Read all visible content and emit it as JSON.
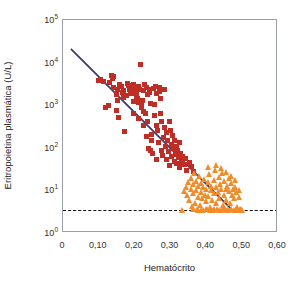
{
  "chart_data": {
    "type": "scatter",
    "title": "",
    "xlabel": "Hematócrito",
    "ylabel": "Eritropoietina plasmática (U/L)",
    "xlim": [
      0,
      0.6
    ],
    "ylim": [
      1,
      100000
    ],
    "yscale": "log",
    "grid": false,
    "legend": "none",
    "x_ticks": [
      "0",
      "0,10",
      "0,20",
      "0,30",
      "0,40",
      "0,50",
      "0,60"
    ],
    "x_tick_values": [
      0,
      0.1,
      0.2,
      0.3,
      0.4,
      0.5,
      0.6
    ],
    "x_minor_step": 0.05,
    "y_ticks": [
      "10",
      "10",
      "10",
      "10",
      "10",
      "10"
    ],
    "y_tick_exponents": [
      "0",
      "1",
      "2",
      "3",
      "4",
      "5"
    ],
    "y_tick_values": [
      1,
      10,
      100,
      1000,
      10000,
      100000
    ],
    "series": [
      {
        "name": "anemic-patients",
        "marker": "square",
        "color": "#be2e26",
        "points": [
          [
            0.1,
            3900
          ],
          [
            0.104,
            4100
          ],
          [
            0.112,
            3600
          ],
          [
            0.118,
            900
          ],
          [
            0.126,
            960
          ],
          [
            0.131,
            3500
          ],
          [
            0.135,
            5000
          ],
          [
            0.138,
            4300
          ],
          [
            0.14,
            4600
          ],
          [
            0.142,
            2600
          ],
          [
            0.148,
            1800
          ],
          [
            0.15,
            760
          ],
          [
            0.152,
            2400
          ],
          [
            0.156,
            520
          ],
          [
            0.158,
            3000
          ],
          [
            0.162,
            2800
          ],
          [
            0.166,
            2000
          ],
          [
            0.168,
            1500
          ],
          [
            0.17,
            2200
          ],
          [
            0.172,
            240
          ],
          [
            0.176,
            1700
          ],
          [
            0.18,
            3200
          ],
          [
            0.182,
            2900
          ],
          [
            0.186,
            2300
          ],
          [
            0.19,
            2600
          ],
          [
            0.192,
            1900
          ],
          [
            0.196,
            1250
          ],
          [
            0.198,
            3100
          ],
          [
            0.2,
            2700
          ],
          [
            0.202,
            2500
          ],
          [
            0.204,
            1600
          ],
          [
            0.206,
            2100
          ],
          [
            0.208,
            1400
          ],
          [
            0.21,
            1150
          ],
          [
            0.212,
            2800
          ],
          [
            0.214,
            2400
          ],
          [
            0.216,
            9000
          ],
          [
            0.218,
            1000
          ],
          [
            0.22,
            880
          ],
          [
            0.222,
            1300
          ],
          [
            0.224,
            2200
          ],
          [
            0.226,
            700
          ],
          [
            0.228,
            3100
          ],
          [
            0.23,
            640
          ],
          [
            0.232,
            180
          ],
          [
            0.234,
            2600
          ],
          [
            0.236,
            420
          ],
          [
            0.238,
            96
          ],
          [
            0.24,
            2000
          ],
          [
            0.242,
            2300
          ],
          [
            0.244,
            1100
          ],
          [
            0.246,
            200
          ],
          [
            0.248,
            150
          ],
          [
            0.25,
            74
          ],
          [
            0.252,
            2500
          ],
          [
            0.256,
            560
          ],
          [
            0.258,
            2800
          ],
          [
            0.26,
            1900
          ],
          [
            0.262,
            340
          ],
          [
            0.264,
            260
          ],
          [
            0.266,
            130
          ],
          [
            0.268,
            2100
          ],
          [
            0.27,
            2600
          ],
          [
            0.272,
            640
          ],
          [
            0.274,
            88
          ],
          [
            0.276,
            420
          ],
          [
            0.278,
            66
          ],
          [
            0.28,
            170
          ],
          [
            0.282,
            2300
          ],
          [
            0.284,
            300
          ],
          [
            0.286,
            110
          ],
          [
            0.288,
            52
          ],
          [
            0.29,
            230
          ],
          [
            0.292,
            150
          ],
          [
            0.294,
            82
          ],
          [
            0.296,
            38
          ],
          [
            0.298,
            420
          ],
          [
            0.3,
            260
          ],
          [
            0.302,
            120
          ],
          [
            0.304,
            64
          ],
          [
            0.306,
            190
          ],
          [
            0.308,
            95
          ],
          [
            0.31,
            48
          ],
          [
            0.312,
            150
          ],
          [
            0.314,
            70
          ],
          [
            0.316,
            110
          ],
          [
            0.318,
            42
          ],
          [
            0.32,
            86
          ],
          [
            0.322,
            58
          ],
          [
            0.324,
            130
          ],
          [
            0.326,
            34
          ],
          [
            0.328,
            72
          ],
          [
            0.33,
            46
          ],
          [
            0.334,
            62
          ],
          [
            0.338,
            40
          ],
          [
            0.342,
            55
          ],
          [
            0.346,
            30
          ],
          [
            0.352,
            44
          ],
          [
            0.358,
            36
          ],
          [
            0.364,
            28
          ],
          [
            0.152,
            1300
          ],
          [
            0.188,
            2050
          ],
          [
            0.236,
            1750
          ],
          [
            0.254,
            1050
          ],
          [
            0.272,
            1450
          ],
          [
            0.226,
            330
          ],
          [
            0.244,
            86
          ],
          [
            0.262,
            54
          ],
          [
            0.196,
            640
          ],
          [
            0.21,
            480
          ]
        ]
      },
      {
        "name": "normal-subjects",
        "marker": "triangle",
        "color": "#f28c28",
        "points": [
          [
            0.332,
            3.5
          ],
          [
            0.338,
            9.5
          ],
          [
            0.342,
            12
          ],
          [
            0.346,
            8
          ],
          [
            0.35,
            16
          ],
          [
            0.352,
            6
          ],
          [
            0.356,
            11
          ],
          [
            0.358,
            20
          ],
          [
            0.36,
            4.2
          ],
          [
            0.362,
            14
          ],
          [
            0.364,
            8.5
          ],
          [
            0.366,
            25
          ],
          [
            0.368,
            5
          ],
          [
            0.37,
            10
          ],
          [
            0.372,
            17
          ],
          [
            0.374,
            3.6
          ],
          [
            0.376,
            13
          ],
          [
            0.378,
            7
          ],
          [
            0.38,
            22
          ],
          [
            0.382,
            4.5
          ],
          [
            0.384,
            9
          ],
          [
            0.386,
            15
          ],
          [
            0.388,
            6.5
          ],
          [
            0.39,
            3.5
          ],
          [
            0.392,
            12
          ],
          [
            0.394,
            19
          ],
          [
            0.396,
            8
          ],
          [
            0.398,
            5.5
          ],
          [
            0.4,
            11
          ],
          [
            0.402,
            3.6
          ],
          [
            0.404,
            16
          ],
          [
            0.406,
            7.5
          ],
          [
            0.408,
            24
          ],
          [
            0.41,
            4
          ],
          [
            0.412,
            10
          ],
          [
            0.414,
            13
          ],
          [
            0.416,
            6
          ],
          [
            0.418,
            3.5
          ],
          [
            0.42,
            18
          ],
          [
            0.422,
            8.5
          ],
          [
            0.424,
            30
          ],
          [
            0.426,
            5
          ],
          [
            0.428,
            12
          ],
          [
            0.43,
            3.6
          ],
          [
            0.432,
            9
          ],
          [
            0.434,
            21
          ],
          [
            0.436,
            6.5
          ],
          [
            0.438,
            14
          ],
          [
            0.44,
            3.5
          ],
          [
            0.442,
            10.5
          ],
          [
            0.444,
            26
          ],
          [
            0.446,
            4.5
          ],
          [
            0.448,
            8
          ],
          [
            0.45,
            17
          ],
          [
            0.452,
            3.6
          ],
          [
            0.454,
            11
          ],
          [
            0.456,
            6
          ],
          [
            0.458,
            13
          ],
          [
            0.46,
            3.5
          ],
          [
            0.462,
            9.5
          ],
          [
            0.464,
            20
          ],
          [
            0.466,
            5
          ],
          [
            0.468,
            15
          ],
          [
            0.47,
            3.6
          ],
          [
            0.472,
            8
          ],
          [
            0.474,
            11
          ],
          [
            0.476,
            3.5
          ],
          [
            0.478,
            6.5
          ],
          [
            0.48,
            12
          ],
          [
            0.482,
            3.6
          ],
          [
            0.484,
            9
          ],
          [
            0.486,
            4
          ],
          [
            0.488,
            3.5
          ],
          [
            0.492,
            7
          ],
          [
            0.496,
            3.6
          ],
          [
            0.5,
            3.5
          ],
          [
            0.404,
            36
          ],
          [
            0.428,
            40
          ],
          [
            0.44,
            33
          ],
          [
            0.456,
            27
          ],
          [
            0.468,
            22
          ],
          [
            0.48,
            18
          ],
          [
            0.49,
            10
          ],
          [
            0.386,
            3.5
          ],
          [
            0.398,
            3.6
          ],
          [
            0.41,
            3.5
          ],
          [
            0.422,
            3.6
          ],
          [
            0.434,
            3.5
          ],
          [
            0.446,
            3.6
          ],
          [
            0.458,
            3.5
          ],
          [
            0.47,
            3.6
          ],
          [
            0.482,
            3.5
          ],
          [
            0.364,
            3.6
          ],
          [
            0.376,
            3.5
          ],
          [
            0.494,
            3.6
          ],
          [
            0.498,
            3.5
          ]
        ]
      }
    ],
    "regression_line": {
      "name": "regression-line",
      "color": "#3b3b6d",
      "x_start": 0.022,
      "y_start": 21000,
      "x_end": 0.472,
      "y_end": 3.5
    },
    "reference_line": {
      "name": "detection-limit-line",
      "style": "dashed",
      "color": "#111111",
      "y_value": 3.5,
      "x_start": 0.0,
      "x_end": 0.6
    }
  }
}
